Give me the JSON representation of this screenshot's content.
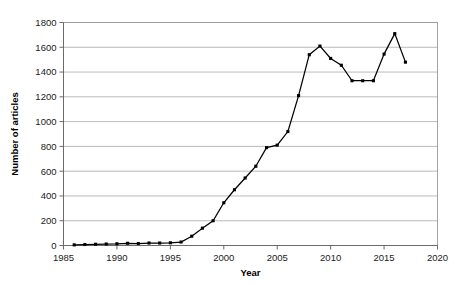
{
  "chart_data": {
    "type": "line",
    "title": "",
    "xlabel": "Year",
    "ylabel": "Number of articles",
    "xlim": [
      1985,
      2020
    ],
    "ylim": [
      0,
      1800
    ],
    "xticks": [
      1985,
      1990,
      1995,
      2000,
      2005,
      2010,
      2015,
      2020
    ],
    "yticks": [
      0,
      200,
      400,
      600,
      800,
      1000,
      1200,
      1400,
      1600,
      1800
    ],
    "grid": "horizontal",
    "legend": "none",
    "marker": "square",
    "line_color": "#000000",
    "marker_color": "#000000",
    "grid_color": "#a8a8a8",
    "x": [
      1986,
      1987,
      1988,
      1989,
      1990,
      1991,
      1992,
      1993,
      1994,
      1995,
      1996,
      1997,
      1998,
      1999,
      2000,
      2001,
      2002,
      2003,
      2004,
      2005,
      2006,
      2007,
      2008,
      2009,
      2010,
      2011,
      2012,
      2013,
      2014,
      2015,
      2016,
      2017
    ],
    "values": [
      5,
      8,
      10,
      12,
      14,
      18,
      16,
      20,
      20,
      22,
      28,
      75,
      140,
      200,
      345,
      450,
      545,
      640,
      790,
      810,
      920,
      1210,
      1540,
      1610,
      1510,
      1455,
      1330,
      1330,
      1330,
      1545,
      1710,
      1480
    ],
    "series": [
      {
        "name": "Number of articles",
        "values": [
          5,
          8,
          10,
          12,
          14,
          18,
          16,
          20,
          20,
          22,
          28,
          75,
          140,
          200,
          345,
          450,
          545,
          640,
          790,
          810,
          920,
          1210,
          1540,
          1610,
          1510,
          1455,
          1330,
          1330,
          1330,
          1545,
          1710,
          1480
        ]
      }
    ]
  },
  "axes": {
    "x_tick_labels": [
      "1985",
      "1990",
      "1995",
      "2000",
      "2005",
      "2010",
      "2015",
      "2020"
    ],
    "y_tick_labels": [
      "0",
      "200",
      "400",
      "600",
      "800",
      "1000",
      "1200",
      "1400",
      "1600",
      "1800"
    ],
    "x_axis_title": "Year",
    "y_axis_title": "Number of articles"
  }
}
